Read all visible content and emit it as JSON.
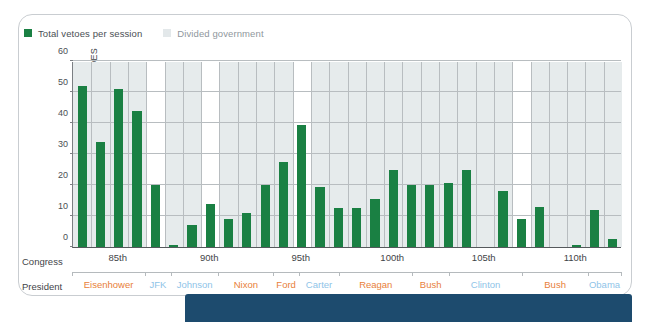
{
  "legend": {
    "items": [
      {
        "label": "Total vetoes per session",
        "swatch": "green",
        "color": "#1a8043"
      },
      {
        "label": "Divided government",
        "swatch": "gray",
        "color": "#e6ebec"
      }
    ]
  },
  "axis_rows": {
    "congress_label": "Congress",
    "president_label": "President"
  },
  "colors": {
    "bar_green": "#1a8043",
    "divided_band": "#e6ebec",
    "republican": "#e8803a",
    "democrat": "#8fc4e8",
    "banner_navy": "#1d4b6e",
    "gridline": "#b8bdc0",
    "axis": "#55595c"
  },
  "chart_data": {
    "type": "bar",
    "title": "",
    "xlabel": "Congress",
    "ylabel": "NUMBER OF VETOES",
    "ylim": [
      0,
      60
    ],
    "yticks": [
      0,
      10,
      20,
      30,
      40,
      50,
      60
    ],
    "grid": true,
    "legend_position": "top-left",
    "categories": [
      "83rd",
      "84th",
      "85th",
      "86th",
      "87th",
      "88th",
      "89th",
      "90th",
      "91st",
      "92nd",
      "93rd",
      "94th",
      "95th",
      "96th",
      "97th",
      "98th",
      "99th",
      "100th",
      "101st",
      "102nd",
      "103rd",
      "104th",
      "105th",
      "106th",
      "107th",
      "108th",
      "109th",
      "110th",
      "111th",
      "112th"
    ],
    "values": [
      52,
      34,
      51,
      44,
      20,
      0.7,
      7,
      14,
      9,
      11,
      20,
      27.5,
      39.5,
      19.5,
      12.5,
      12.5,
      15.5,
      25,
      20,
      20,
      20.5,
      25,
      0,
      18,
      9,
      13,
      0,
      0.8,
      12,
      2.5
    ],
    "divided_government_shaded": true,
    "annotations": {
      "congress_ticks": [
        "85th",
        "90th",
        "95th",
        "100th",
        "105th",
        "110th"
      ],
      "presidents": [
        {
          "name": "Eisenhower",
          "party": "rep"
        },
        {
          "name": "JFK",
          "party": "dem"
        },
        {
          "name": "Johnson",
          "party": "dem"
        },
        {
          "name": "Nixon",
          "party": "rep"
        },
        {
          "name": "Ford",
          "party": "rep"
        },
        {
          "name": "Carter",
          "party": "dem"
        },
        {
          "name": "Reagan",
          "party": "rep"
        },
        {
          "name": "Bush",
          "party": "rep"
        },
        {
          "name": "Clinton",
          "party": "dem"
        },
        {
          "name": "Bush",
          "party": "rep"
        },
        {
          "name": "Obama",
          "party": "dem"
        }
      ]
    }
  }
}
